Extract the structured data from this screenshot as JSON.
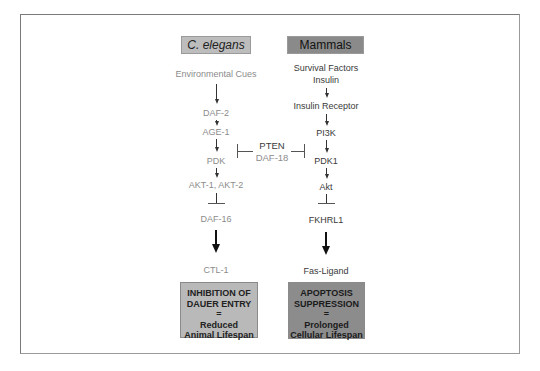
{
  "figure": {
    "headers": {
      "left": "C. elegans",
      "right": "Mammals"
    },
    "left_pathway": {
      "nodes": [
        "Environmental Cues",
        "DAF-2",
        "AGE-1",
        "PDK",
        "AKT-1, AKT-2",
        "DAF-16",
        "CTL-1"
      ],
      "outcome": [
        "INHIBITION OF",
        "DAUER ENTRY",
        "=",
        "Reduced",
        "Animal Lifespan"
      ]
    },
    "right_pathway": {
      "nodes": [
        "Survival Factors",
        "Insulin",
        "Insulin Receptor",
        "PI3K",
        "PDK1",
        "Akt",
        "FKHRL1",
        "Fas-Ligand"
      ],
      "outcome": [
        "APOPTOSIS",
        "SUPPRESSION",
        "=",
        "Prolonged",
        "Cellular Lifespan"
      ]
    },
    "inhibitor": {
      "mammal_name": "PTEN",
      "worm_name": "DAF-18"
    },
    "colors": {
      "left_header": "#bdbdbd",
      "right_header": "#8a8a8a",
      "left_outcome": "#b9b9b9",
      "right_outcome": "#8c8c8c"
    }
  }
}
